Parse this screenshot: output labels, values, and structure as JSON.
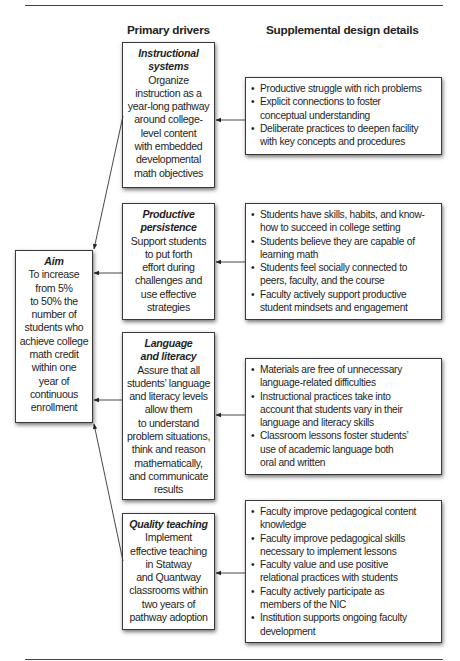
{
  "headings": {
    "primary": "Primary drivers",
    "supplemental": "Supplemental design details"
  },
  "aim": {
    "title": "Aim",
    "body": "To increase\nfrom 5%\nto 50% the\nnumber of\nstudents who\nachieve college\nmath credit\nwithin one\nyear of\ncontinuous\nenrollment"
  },
  "drivers": [
    {
      "title": "Instructional\nsystems",
      "body": "Organize\ninstruction as a\nyear-long pathway\naround college-\nlevel content\nwith embedded\ndevelopmental\nmath objectives",
      "details": [
        "Productive struggle with rich problems",
        "Explicit connections to foster\nconceptual understanding",
        "Deliberate practices to deepen facility\nwith key concepts and procedures"
      ]
    },
    {
      "title": "Productive\npersistence",
      "body": "Support students\nto put forth\neffort during\nchallenges and\nuse effective\nstrategies",
      "details": [
        "Students have skills, habits, and know-\nhow to succeed in college setting",
        "Students believe they are capable of\nlearning math",
        "Students feel socially connected to\npeers, faculty, and the course",
        "Faculty actively support productive\nstudent mindsets and engagement"
      ]
    },
    {
      "title": "Language\nand literacy",
      "body": "Assure that all\nstudents’ language\nand literacy levels\nallow them\nto understand\nproblem situations,\nthink and reason\nmathematically,\nand communicate\nresults",
      "details": [
        "Materials are free of unnecessary\nlanguage-related difficulties",
        "Instructional practices take into\naccount that students vary in their\nlanguage and literacy skills",
        "Classroom lessons foster students’\nuse of academic language both\noral and written"
      ]
    },
    {
      "title": "Quality teaching",
      "body": "Implement\neffective teaching\nin Statway\nand Quantway\nclassrooms within\ntwo years of\npathway adoption",
      "details": [
        "Faculty improve pedagogical content\nknowledge",
        "Faculty improve pedagogical skills\nnecessary to implement lessons",
        "Faculty value and use positive\nrelational practices with students",
        "Faculty actively participate as\nmembers of the NIC",
        "Institution supports ongoing faculty\ndevelopment"
      ]
    }
  ],
  "bullet_glyph": "•"
}
